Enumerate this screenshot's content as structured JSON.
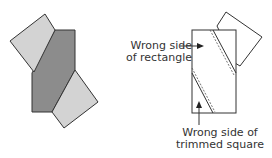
{
  "diagram": {
    "colors": {
      "dark_fill": "#8c8c8c",
      "light_fill": "#d3d3d3",
      "stroke": "#333333",
      "background": "#ffffff"
    },
    "left_figure": {
      "description": "Dark rectangle with trimmed squares sewn on opposite diagonal corners"
    },
    "right_figure": {
      "labels": {
        "rectangle": {
          "line1": "Wrong side",
          "line2": "of rectangle"
        },
        "square": {
          "line1": "Wrong side of",
          "line2": "trimmed square"
        }
      }
    }
  }
}
